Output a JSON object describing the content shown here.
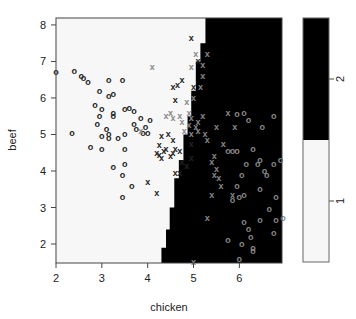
{
  "chart_data": {
    "type": "scatter",
    "subtype": "classification-plot",
    "title": "",
    "xlabel": "chicken",
    "ylabel": "beef",
    "xlim": [
      2,
      6.93
    ],
    "ylim": [
      1.48,
      8.19
    ],
    "xticks": [
      2,
      3,
      4,
      5,
      6
    ],
    "yticks": [
      2,
      3,
      4,
      5,
      6,
      7,
      8
    ],
    "grid": false,
    "regions": {
      "class_1_color": "#f7f7f7",
      "class_2_color": "#000000",
      "boundary": [
        {
          "y": 8.19,
          "x": 5.26
        },
        {
          "y": 7.5,
          "x": 5.26
        },
        {
          "y": 7.5,
          "x": 5.15
        },
        {
          "y": 7.0,
          "x": 5.15
        },
        {
          "y": 7.0,
          "x": 5.05
        },
        {
          "y": 6.2,
          "x": 5.05
        },
        {
          "y": 6.2,
          "x": 4.95
        },
        {
          "y": 5.5,
          "x": 4.95
        },
        {
          "y": 5.5,
          "x": 4.87
        },
        {
          "y": 5.0,
          "x": 4.87
        },
        {
          "y": 5.0,
          "x": 4.78
        },
        {
          "y": 4.3,
          "x": 4.78
        },
        {
          "y": 4.3,
          "x": 4.68
        },
        {
          "y": 3.8,
          "x": 4.68
        },
        {
          "y": 3.8,
          "x": 4.58
        },
        {
          "y": 3.0,
          "x": 4.58
        },
        {
          "y": 3.0,
          "x": 4.48
        },
        {
          "y": 2.4,
          "x": 4.48
        },
        {
          "y": 2.4,
          "x": 4.4
        },
        {
          "y": 1.9,
          "x": 4.4
        },
        {
          "y": 1.9,
          "x": 4.3
        },
        {
          "y": 1.48,
          "x": 4.3
        }
      ]
    },
    "series": [
      {
        "name": "class 1 (o, correctly classified)",
        "marker": "o",
        "color": "#222222",
        "points": [
          [
            2.0,
            6.7
          ],
          [
            2.4,
            6.75
          ],
          [
            2.55,
            6.6
          ],
          [
            2.6,
            6.55
          ],
          [
            2.7,
            6.45
          ],
          [
            3.15,
            6.5
          ],
          [
            3.45,
            6.5
          ],
          [
            2.95,
            6.2
          ],
          [
            3.15,
            6.05
          ],
          [
            3.25,
            6.1
          ],
          [
            2.85,
            5.8
          ],
          [
            3.0,
            5.7
          ],
          [
            2.95,
            5.5
          ],
          [
            3.25,
            5.6
          ],
          [
            3.25,
            5.5
          ],
          [
            3.5,
            5.7
          ],
          [
            3.6,
            5.72
          ],
          [
            3.7,
            5.65
          ],
          [
            3.85,
            5.45
          ],
          [
            4.05,
            5.4
          ],
          [
            2.9,
            5.3
          ],
          [
            3.1,
            5.15
          ],
          [
            3.15,
            5.0
          ],
          [
            3.0,
            4.95
          ],
          [
            3.15,
            4.9
          ],
          [
            3.35,
            4.9
          ],
          [
            3.7,
            5.3
          ],
          [
            3.75,
            5.15
          ],
          [
            3.95,
            5.2
          ],
          [
            3.9,
            5.05
          ],
          [
            4.0,
            5.05
          ],
          [
            2.35,
            5.05
          ],
          [
            3.5,
            5.0
          ],
          [
            3.0,
            4.6
          ],
          [
            2.75,
            4.65
          ],
          [
            3.5,
            4.6
          ],
          [
            3.5,
            4.2
          ],
          [
            3.25,
            4.1
          ],
          [
            3.45,
            3.9
          ],
          [
            3.65,
            3.6
          ],
          [
            3.45,
            3.3
          ]
        ]
      },
      {
        "name": "class 2 (x, correctly classified)",
        "marker": "x",
        "color": "#222222",
        "points": [
          [
            4.95,
            7.65
          ],
          [
            5.1,
            7.0
          ],
          [
            4.75,
            6.5
          ],
          [
            4.65,
            6.35
          ],
          [
            4.55,
            6.3
          ],
          [
            5.0,
            6.3
          ],
          [
            4.6,
            5.95
          ],
          [
            4.45,
            5.0
          ],
          [
            4.55,
            4.85
          ],
          [
            4.3,
            4.95
          ],
          [
            4.25,
            4.7
          ],
          [
            4.2,
            4.5
          ],
          [
            4.25,
            4.45
          ],
          [
            4.35,
            4.55
          ],
          [
            4.5,
            4.4
          ],
          [
            4.55,
            4.5
          ],
          [
            4.6,
            4.6
          ],
          [
            4.7,
            4.55
          ],
          [
            4.75,
            4.25
          ],
          [
            4.85,
            4.15
          ],
          [
            4.95,
            4.35
          ],
          [
            4.3,
            4.35
          ],
          [
            4.4,
            4.6
          ],
          [
            4.95,
            4.75
          ],
          [
            4.0,
            3.7
          ],
          [
            4.2,
            3.4
          ],
          [
            4.6,
            3.95
          ],
          [
            4.7,
            3.95
          ]
        ]
      },
      {
        "name": "class 2 (x, gray)",
        "marker": "x",
        "color": "#888888",
        "points": [
          [
            5.05,
            7.2
          ],
          [
            5.3,
            7.2
          ],
          [
            4.95,
            6.85
          ],
          [
            5.2,
            6.9
          ],
          [
            4.1,
            6.85
          ],
          [
            5.2,
            6.6
          ],
          [
            5.15,
            6.3
          ],
          [
            5.0,
            6.0
          ],
          [
            4.85,
            5.9
          ],
          [
            4.4,
            5.5
          ],
          [
            4.5,
            5.6
          ],
          [
            4.55,
            5.45
          ],
          [
            4.7,
            5.5
          ],
          [
            4.75,
            5.35
          ],
          [
            4.9,
            5.25
          ],
          [
            5.05,
            5.2
          ],
          [
            5.1,
            5.35
          ],
          [
            5.2,
            5.5
          ],
          [
            4.8,
            5.1
          ],
          [
            4.95,
            5.0
          ],
          [
            5.1,
            5.1
          ],
          [
            5.25,
            5.0
          ],
          [
            5.3,
            4.85
          ],
          [
            5.5,
            5.2
          ],
          [
            5.65,
            4.75
          ],
          [
            5.9,
            5.2
          ],
          [
            5.75,
            5.6
          ],
          [
            5.45,
            4.4
          ],
          [
            5.4,
            4.25
          ],
          [
            5.5,
            4.05
          ],
          [
            5.45,
            3.9
          ],
          [
            5.55,
            3.8
          ],
          [
            5.6,
            3.6
          ],
          [
            5.4,
            3.35
          ],
          [
            5.85,
            3.35
          ],
          [
            5.3,
            2.7
          ],
          [
            4.9,
            5.6
          ],
          [
            4.95,
            5.45
          ],
          [
            3.85,
            5.1
          ],
          [
            5.0,
            1.5
          ]
        ]
      },
      {
        "name": "class 1 (o, gray, misclassified)",
        "marker": "o",
        "color": "#888888",
        "points": [
          [
            5.95,
            5.55
          ],
          [
            6.1,
            5.6
          ],
          [
            6.2,
            5.4
          ],
          [
            6.5,
            5.2
          ],
          [
            6.75,
            5.5
          ],
          [
            5.75,
            4.55
          ],
          [
            5.85,
            4.55
          ],
          [
            5.95,
            4.55
          ],
          [
            6.3,
            4.6
          ],
          [
            6.45,
            4.3
          ],
          [
            6.15,
            4.2
          ],
          [
            6.4,
            4.2
          ],
          [
            6.55,
            4.0
          ],
          [
            6.6,
            3.9
          ],
          [
            6.75,
            4.2
          ],
          [
            6.9,
            4.3
          ],
          [
            6.05,
            3.9
          ],
          [
            6.0,
            3.3
          ],
          [
            6.1,
            3.35
          ],
          [
            6.45,
            3.5
          ],
          [
            6.8,
            3.3
          ],
          [
            6.65,
            2.95
          ],
          [
            6.45,
            2.65
          ],
          [
            6.8,
            2.65
          ],
          [
            5.85,
            3.2
          ],
          [
            5.95,
            3.6
          ],
          [
            6.1,
            2.6
          ],
          [
            6.2,
            2.4
          ],
          [
            6.05,
            2.0
          ],
          [
            6.25,
            2.2
          ],
          [
            6.3,
            1.9
          ],
          [
            5.75,
            2.1
          ],
          [
            6.0,
            1.6
          ],
          [
            6.3,
            1.8
          ],
          [
            6.75,
            2.3
          ],
          [
            6.95,
            2.7
          ]
        ]
      }
    ],
    "legend": {
      "type": "colorbar",
      "position": "right",
      "levels": [
        {
          "label": "1",
          "color": "#f7f7f7"
        },
        {
          "label": "2",
          "color": "#000000"
        }
      ]
    }
  }
}
